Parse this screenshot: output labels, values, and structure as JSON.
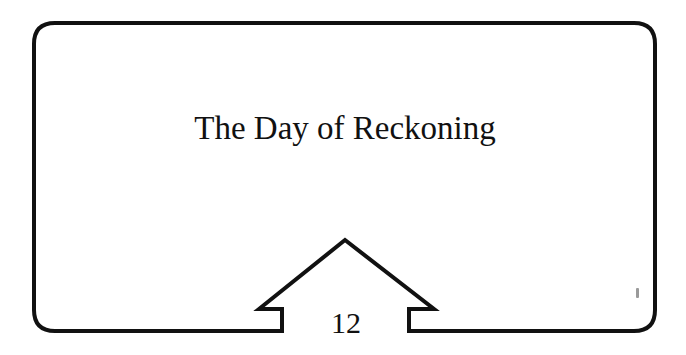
{
  "card": {
    "title": "The Day of Reckoning",
    "number": "12",
    "border_color": "#111111",
    "background": "#ffffff"
  }
}
